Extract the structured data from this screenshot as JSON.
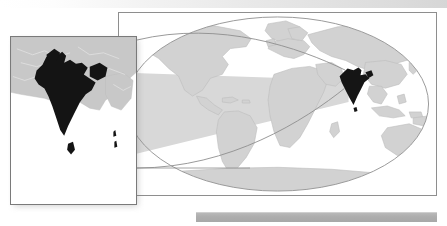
{
  "figure": {
    "kind": "map-figure",
    "background_color": "#ffffff"
  },
  "top_band": {
    "name": "top-gradient-band",
    "from_color": "#ffffff",
    "to_color": "#d6d6d6"
  },
  "bottom_band": {
    "name": "bottom-gray-bar",
    "color": "#aeaeae"
  },
  "world_map": {
    "projection": "elliptical-world",
    "frame_color": "#8e8e8e",
    "ocean_color": "#ffffff",
    "land_color": "#d2d2d2",
    "land_outline_color": "#bdbdbd",
    "graticule_color": "#9a9a9a",
    "highlight_country": "India",
    "highlight_color": "#151515",
    "wedge_color": "#d8d8d8",
    "wedge_note": "shaded cone spreading left from India",
    "india_marker": {
      "x": 348,
      "y": 78
    }
  },
  "inset_map": {
    "region": "India",
    "frame_color": "#7a7a7a",
    "ocean_color": "#ffffff",
    "land_color": "#c8c8c8",
    "land_outline_color": "#b2b2b2",
    "country_color": "#141414",
    "shadow_color": "#787878",
    "neighbors_visible": [
      "Sri Lanka",
      "Bangladesh",
      "Nepal",
      "Pakistan",
      "Myanmar"
    ]
  },
  "leader_lines": {
    "color": "#8e8e8e",
    "count": 2
  }
}
